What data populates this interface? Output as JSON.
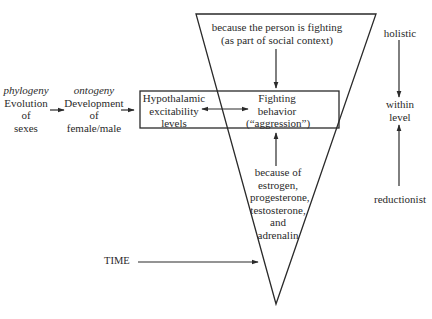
{
  "diagram": {
    "left_chain": {
      "phylogeny": {
        "tag": "phylogeny",
        "lines": [
          "Evolution",
          "of",
          "sexes"
        ]
      },
      "ontogeny": {
        "tag": "ontogeny",
        "lines": [
          "Development",
          "of",
          "female/male"
        ]
      }
    },
    "box": {
      "hypothalamic": [
        "Hypothalamic",
        "excitability",
        "levels"
      ],
      "fighting": [
        "Fighting",
        "behavior",
        "(“aggression”)"
      ]
    },
    "triangle": {
      "top_cause": [
        "because the person is fighting",
        "(as part of social context)"
      ],
      "bottom_cause": [
        "because of",
        "estrogen,",
        "progesterone,",
        "testosterone,",
        "and",
        "adrenalin"
      ]
    },
    "time_label": "TIME",
    "right_axis": {
      "top": "holistic",
      "middle": [
        "within",
        "level"
      ],
      "bottom": "reductionist"
    },
    "colors": {
      "line": "#2a2a2a",
      "text": "#2a2a2a",
      "background": "#ffffff"
    }
  }
}
